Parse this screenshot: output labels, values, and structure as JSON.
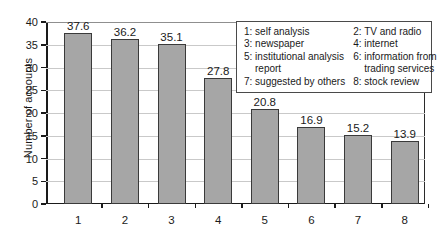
{
  "chart_data": {
    "type": "bar",
    "title": "",
    "xlabel": "",
    "ylabel": "Number of accounts",
    "categories": [
      "1",
      "2",
      "3",
      "4",
      "5",
      "6",
      "7",
      "8"
    ],
    "values": [
      37.6,
      36.2,
      35.1,
      27.8,
      20.8,
      16.9,
      15.2,
      13.9
    ],
    "value_labels": [
      "37.6",
      "36.2",
      "35.1",
      "27.8",
      "20.8",
      "16.9",
      "15.2",
      "13.9"
    ],
    "ylim": [
      0,
      40
    ],
    "yticks": [
      0,
      5,
      10,
      15,
      20,
      25,
      30,
      35,
      40
    ],
    "ytick_labels": [
      "0",
      "5",
      "10",
      "15",
      "20",
      "25",
      "30",
      "35",
      "40"
    ],
    "grid": "horizontal",
    "legend_position": "upper-right-inside",
    "bar_color": "#a6a6a6",
    "bar_edge_color": "#3a3a3a",
    "grid_color": "#c9c9c9",
    "axis_color": "#1a1a1a",
    "legend": {
      "columns": [
        [
          {
            "key": "1",
            "label": "1: self analysis",
            "cont": ""
          },
          {
            "key": "3",
            "label": "3: newspaper",
            "cont": ""
          },
          {
            "key": "5",
            "label": "5: institutional analysis",
            "cont": "report"
          },
          {
            "key": "7",
            "label": "7: suggested by others",
            "cont": ""
          }
        ],
        [
          {
            "key": "2",
            "label": "2: TV and radio",
            "cont": ""
          },
          {
            "key": "4",
            "label": "4: internet",
            "cont": ""
          },
          {
            "key": "6",
            "label": "6: information from",
            "cont": "trading services"
          },
          {
            "key": "8",
            "label": "8: stock review",
            "cont": ""
          }
        ]
      ]
    }
  }
}
